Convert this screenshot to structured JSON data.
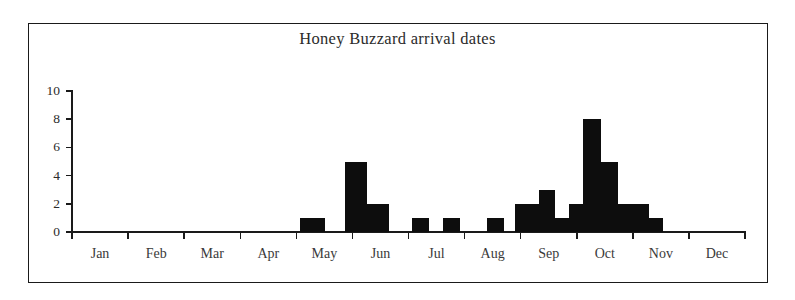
{
  "chart_data": {
    "type": "bar",
    "title": "Honey Buzzard arrival dates",
    "xlabel": "",
    "ylabel": "",
    "ylim": [
      0,
      10
    ],
    "ytick_labels": [
      "0",
      "2",
      "4",
      "6",
      "8",
      "10"
    ],
    "ytick_values": [
      0,
      2,
      4,
      6,
      8,
      10
    ],
    "grid": false,
    "legend": null,
    "categories": [
      "Jan",
      "Feb",
      "Mar",
      "Apr",
      "May",
      "Jun",
      "Jul",
      "Aug",
      "Sep",
      "Oct",
      "Nov",
      "Dec"
    ],
    "bin_description": "half-month bins",
    "bins": [
      {
        "label": "Jan 1",
        "value": 0
      },
      {
        "label": "Jan 2",
        "value": 0
      },
      {
        "label": "Feb 1",
        "value": 0
      },
      {
        "label": "Feb 2",
        "value": 0
      },
      {
        "label": "Mar 1",
        "value": 0
      },
      {
        "label": "Mar 2",
        "value": 0
      },
      {
        "label": "Apr 1",
        "value": 0
      },
      {
        "label": "Apr 2",
        "value": 0
      },
      {
        "label": "May 1",
        "value": 1
      },
      {
        "label": "May 2",
        "value": 0
      },
      {
        "label": "Jun 1",
        "value": 5
      },
      {
        "label": "Jun 2",
        "value": 2
      },
      {
        "label": "Jun 3",
        "value": 0
      },
      {
        "label": "Jul 1",
        "value": 0
      },
      {
        "label": "Jul 2",
        "value": 1
      },
      {
        "label": "Jul 3",
        "value": 1
      },
      {
        "label": "Aug 1",
        "value": 0
      },
      {
        "label": "Aug 2",
        "value": 1
      },
      {
        "label": "Aug 3",
        "value": 0
      },
      {
        "label": "Sep 1",
        "value": 2
      },
      {
        "label": "Sep 2",
        "value": 3
      },
      {
        "label": "Sep 3",
        "value": 1
      },
      {
        "label": "Sep 4",
        "value": 2
      },
      {
        "label": "Sep 5",
        "value": 8
      },
      {
        "label": "Oct 1",
        "value": 5
      },
      {
        "label": "Oct 2",
        "value": 2
      },
      {
        "label": "Oct 3",
        "value": 2
      },
      {
        "label": "Oct 4",
        "value": 1
      },
      {
        "label": "Nov 1",
        "value": 0
      },
      {
        "label": "Nov 2",
        "value": 0
      },
      {
        "label": "Dec 1",
        "value": 0
      },
      {
        "label": "Dec 2",
        "value": 0
      }
    ],
    "bars_drawn": [
      {
        "x": 300,
        "width": 25,
        "value": 1
      },
      {
        "x": 345,
        "width": 22,
        "value": 5
      },
      {
        "x": 367,
        "width": 22,
        "value": 2
      },
      {
        "x": 412,
        "width": 17,
        "value": 1
      },
      {
        "x": 443,
        "width": 17,
        "value": 1
      },
      {
        "x": 487,
        "width": 17,
        "value": 1
      },
      {
        "x": 515,
        "width": 24,
        "value": 2
      },
      {
        "x": 539,
        "width": 16,
        "value": 3
      },
      {
        "x": 555,
        "width": 14,
        "value": 1
      },
      {
        "x": 546,
        "width": 0,
        "value": 0
      },
      {
        "x": 569,
        "width": 14,
        "value": 2
      },
      {
        "x": 583,
        "width": 18,
        "value": 8
      },
      {
        "x": 601,
        "width": 17,
        "value": 5
      },
      {
        "x": 618,
        "width": 17,
        "value": 2
      },
      {
        "x": 635,
        "width": 14,
        "value": 2
      },
      {
        "x": 649,
        "width": 14,
        "value": 1
      }
    ],
    "colors": {
      "bar": "#0d0d0d",
      "axis": "#1a1a1a",
      "text": "#2b2b2b",
      "background": "#ffffff"
    }
  }
}
